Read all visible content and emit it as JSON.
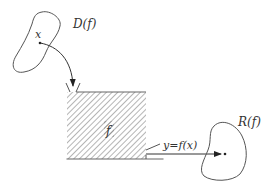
{
  "diagram": {
    "labels": {
      "domain": "D(f)",
      "input": "x",
      "function": "f",
      "output": "y=f(x)",
      "range": "R(f)"
    },
    "colors": {
      "stroke": "#555555",
      "hatch": "#777777",
      "text": "#333333",
      "background": "#ffffff"
    }
  }
}
